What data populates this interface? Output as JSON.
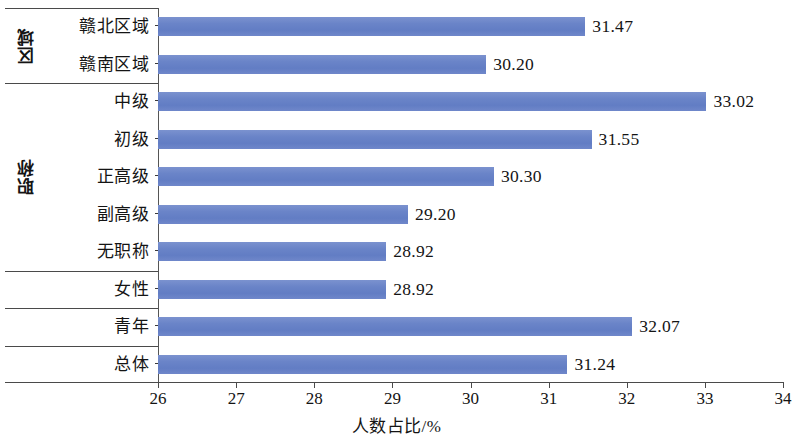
{
  "chart_data": {
    "type": "bar",
    "orientation": "horizontal",
    "title": "",
    "xlabel": "人数占比/%",
    "ylabel": "",
    "xlim": [
      26,
      34
    ],
    "xticks": [
      26,
      27,
      28,
      29,
      30,
      31,
      32,
      33,
      34
    ],
    "grid": false,
    "legend": null,
    "bar_color": "#6a84c8",
    "categories": [
      "赣北区域",
      "赣南区域",
      "中级",
      "初级",
      "正高级",
      "副高级",
      "无职称",
      "女性",
      "青年",
      "总体"
    ],
    "values": [
      31.47,
      30.2,
      33.02,
      31.55,
      30.3,
      29.2,
      28.92,
      28.92,
      32.07,
      31.24
    ],
    "value_labels": [
      "31.47",
      "30.20",
      "33.02",
      "31.55",
      "30.30",
      "29.20",
      "28.92",
      "28.92",
      "32.07",
      "31.24"
    ],
    "groups": [
      {
        "label": "区域",
        "categories": [
          "赣北区域",
          "赣南区域"
        ]
      },
      {
        "label": "职称",
        "categories": [
          "中级",
          "初级",
          "正高级",
          "副高级",
          "无职称"
        ]
      },
      {
        "label": "",
        "categories": [
          "女性"
        ]
      },
      {
        "label": "",
        "categories": [
          "青年"
        ]
      },
      {
        "label": "",
        "categories": [
          "总体"
        ]
      }
    ]
  }
}
